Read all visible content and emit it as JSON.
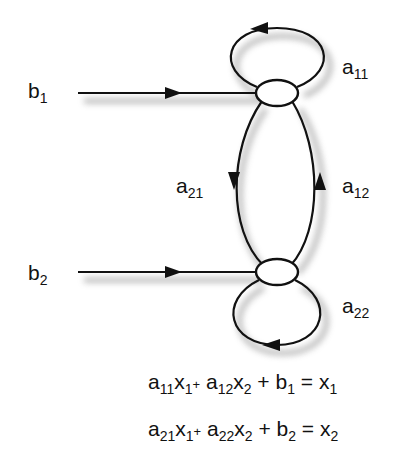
{
  "diagram": {
    "type": "signal-flow-graph",
    "nodes": [
      {
        "id": "x1",
        "label": "x1"
      },
      {
        "id": "x2",
        "label": "x2"
      }
    ],
    "inputs": [
      {
        "base": "b",
        "sub": "1",
        "to": "x1"
      },
      {
        "base": "b",
        "sub": "2",
        "to": "x2"
      }
    ],
    "edges": [
      {
        "base": "a",
        "sub": "11",
        "from": "x1",
        "to": "x1"
      },
      {
        "base": "a",
        "sub": "21",
        "from": "x1",
        "to": "x2"
      },
      {
        "base": "a",
        "sub": "12",
        "from": "x2",
        "to": "x1"
      },
      {
        "base": "a",
        "sub": "22",
        "from": "x2",
        "to": "x2"
      }
    ],
    "equations": [
      {
        "text": "a11x1+ a12x2 + b1 = x1",
        "parts": {
          "a1": "a",
          "s1": "11",
          "x1": "x",
          "xs1": "1",
          "plus1": "+",
          "a2": "a",
          "s2": "12",
          "x2": "x",
          "xs2": "2",
          "rest": " + b",
          "bs": "1",
          "eq": " = x",
          "rs": "1"
        }
      },
      {
        "text": "a21x1+ a22x2 + b2 = x2",
        "parts": {
          "a1": "a",
          "s1": "21",
          "x1": "x",
          "xs1": "1",
          "plus1": "+",
          "a2": "a",
          "s2": "22",
          "x2": "x",
          "xs2": "2",
          "rest": " + b",
          "bs": "2",
          "eq": " = x",
          "rs": "2"
        }
      }
    ],
    "colors": {
      "stroke": "#111111",
      "shadow": "#9a9a9a",
      "background": "#ffffff"
    }
  }
}
